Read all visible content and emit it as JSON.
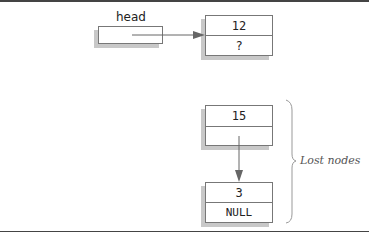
{
  "diagram": {
    "head": {
      "label": "head"
    },
    "nodes": [
      {
        "id": "n12",
        "value": "12",
        "next": "?"
      },
      {
        "id": "n15",
        "value": "15",
        "next": ""
      },
      {
        "id": "n3",
        "value": "3",
        "next": "NULL"
      }
    ],
    "annotation": {
      "label": "Lost nodes"
    },
    "colors": {
      "border": "#777777",
      "shadow": "#c8c8c8",
      "rule": "#444444"
    }
  }
}
